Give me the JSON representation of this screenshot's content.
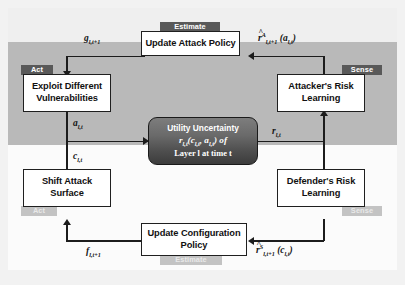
{
  "figure": {
    "bands": {
      "upper_label": "attacker layer band",
      "lower_label": "defender layer band"
    }
  },
  "colors": {
    "band_dark": "#b9b9b9",
    "band_light": "#fbfbfb",
    "frame": "#f0f0f0",
    "badge_dark": "#595959",
    "badge_light": "#c3c3c3",
    "box_fill": "#ffffff",
    "box_border": "#1f1f1f",
    "center_node_top": "#7d7d7d",
    "center_node_bottom": "#3c3c3c",
    "line": "#1c1c1c"
  },
  "boxes": {
    "update_attack_policy": {
      "label": "Update Attack Policy",
      "badge": "Estimate"
    },
    "exploit_vulnerabilities": {
      "label_line1": "Exploit Different",
      "label_line2": "Vulnerabilities",
      "badge": "Act"
    },
    "attacker_risk_learning": {
      "label_line1": "Attacker's Risk",
      "label_line2": "Learning",
      "badge": "Sense"
    },
    "shift_attack_surface": {
      "label_line1": "Shift Attack",
      "label_line2": "Surface",
      "badge": "Act"
    },
    "defender_risk_learning": {
      "label_line1": "Defender's Risk",
      "label_line2": "Learning",
      "badge": "Sense"
    },
    "update_configuration_policy": {
      "label_line1": "Update Configuration",
      "label_line2": "Policy",
      "badge": "Estimate"
    }
  },
  "center_node": {
    "line1": "Utility Uncertainty",
    "line2_base": "r",
    "line2_sub": "l,t",
    "line2_args": "(c",
    "line2_args_sub1": "l,t",
    "line2_args_mid": ", a",
    "line2_args_sub2": "l,t",
    "line2_args_end": ") of",
    "line3": "Layer l at time t"
  },
  "edge_labels": {
    "attack_policy_out": {
      "base": "g",
      "sub": "l,t+1"
    },
    "attacker_reward_est": {
      "base": "r",
      "sup": "A",
      "sub": "l,t+1",
      "arg": "(a",
      "arg_sub": "l,t",
      "arg_end": ")",
      "hat": true
    },
    "attack_action": {
      "base": "a",
      "sub": "l,t"
    },
    "config_action": {
      "base": "c",
      "sub": "l,t"
    },
    "utility": {
      "base": "r",
      "sub": "l,t"
    },
    "config_policy_out": {
      "base": "f",
      "sub": "l,t+1"
    },
    "defender_reward_est": {
      "base": "r",
      "sup": "S",
      "sub": "l,t+1",
      "arg": "(c",
      "arg_sub": "l,t",
      "arg_end": ")",
      "hat": true
    }
  }
}
